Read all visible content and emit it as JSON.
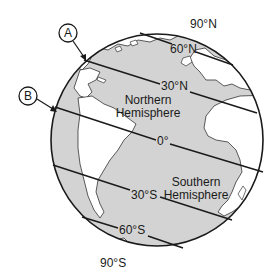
{
  "diagram": {
    "type": "globe-latitude",
    "colors": {
      "ocean": "#d3d3d3",
      "land": "#ffffff",
      "line": "#1a1a1a"
    },
    "markers": [
      {
        "id": "A",
        "label": "A"
      },
      {
        "id": "B",
        "label": "B"
      }
    ],
    "poles": {
      "north": "90°N",
      "south": "90°S"
    },
    "latitudes": [
      {
        "id": "60n",
        "label": "60°N"
      },
      {
        "id": "30n",
        "label": "30°N"
      },
      {
        "id": "eq",
        "label": "0°"
      },
      {
        "id": "30s",
        "label": "30°S"
      },
      {
        "id": "60s",
        "label": "60°S"
      }
    ],
    "hemispheres": {
      "northern": [
        "Northern",
        "Hemisphere"
      ],
      "southern": [
        "Southern",
        "Hemisphere"
      ]
    }
  }
}
